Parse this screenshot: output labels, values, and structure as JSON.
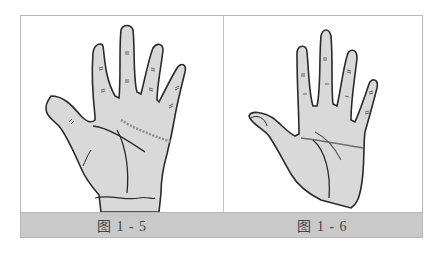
{
  "figure": {
    "panels": [
      {
        "id": "fig-1-5",
        "caption": "图 1 - 5",
        "subject": "palm-with-chained-heart-line",
        "palm_fill": "#d9d9d9",
        "line_color": "#2a2a2a",
        "chain_color": "#8a8a8a"
      },
      {
        "id": "fig-1-6",
        "caption": "图 1 - 6",
        "subject": "palm-with-simian-line",
        "palm_fill": "#d9d9d9",
        "line_color": "#2a2a2a",
        "crease_color": "#6e6e6e"
      }
    ],
    "caption_bar_color": "#c9c9c9",
    "border_color": "#b8b8b8"
  }
}
